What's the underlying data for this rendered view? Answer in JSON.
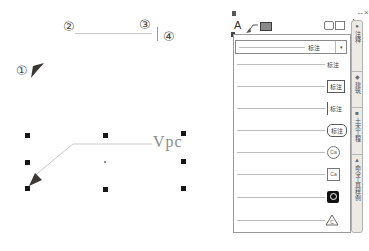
{
  "drawing": {
    "callouts": [
      "①",
      "②",
      "③",
      "④"
    ],
    "leader_text": "Vpc"
  },
  "palette": {
    "titlebar": {
      "autohide": "↔",
      "close": "×"
    },
    "toolbar": {
      "text_tool": "A"
    },
    "style_combo": {
      "label": "标注",
      "dropdown": "▾"
    },
    "tools": [
      {
        "label": "标注",
        "style": "plain"
      },
      {
        "label": "标注",
        "style": "boxed"
      },
      {
        "label": "标注",
        "style": "tick"
      },
      {
        "label": "标注",
        "style": "pill"
      },
      {
        "label": "Ca",
        "style": "circle"
      },
      {
        "label": "Ca",
        "style": "square"
      },
      {
        "label": "",
        "style": "slot"
      },
      {
        "label": "C",
        "style": "triangle"
      }
    ],
    "tabs": [
      {
        "icon": "●",
        "label": "注释"
      },
      {
        "icon": "◆",
        "label": "建筑"
      },
      {
        "icon": "■",
        "label": "土木工程"
      },
      {
        "icon": "▲",
        "label": "命令工具样例"
      }
    ]
  },
  "colors": {
    "leader_line": "#c9c9c9",
    "arrow": "#3a3734",
    "grip": "#161616",
    "panel_border": "#9a9a9a",
    "tabstrip_bg": "#eceae6"
  }
}
